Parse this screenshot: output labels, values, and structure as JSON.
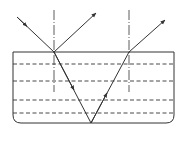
{
  "diagram": {
    "title": "",
    "colors": {
      "line": "#333333",
      "background": "#ffffff"
    },
    "container": {
      "x1": 13,
      "y1": 52,
      "x2": 174,
      "y2": 123,
      "corner_radius": 8
    },
    "dashed_layers_y": [
      64,
      81,
      100,
      113
    ],
    "normals": [
      {
        "x": 54,
        "y1": 10,
        "y2": 92
      },
      {
        "x": 129,
        "y1": 10,
        "y2": 92
      }
    ],
    "rays": [
      {
        "name": "incident-ray",
        "from": [
          17,
          17
        ],
        "to": [
          54,
          52
        ]
      },
      {
        "name": "reflected-ray",
        "from": [
          54,
          52
        ],
        "to": [
          96,
          13
        ]
      },
      {
        "name": "refracted-ray-down",
        "from": [
          54,
          52
        ],
        "to": [
          91,
          123
        ]
      },
      {
        "name": "reflected-ray-up",
        "from": [
          91,
          123
        ],
        "to": [
          129,
          52
        ]
      },
      {
        "name": "emergent-ray",
        "from": [
          129,
          52
        ],
        "to": [
          165,
          20
        ]
      }
    ]
  }
}
